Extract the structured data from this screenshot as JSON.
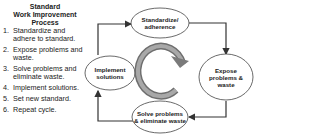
{
  "panel": {
    "title_line1": "Standard",
    "title_line2": "Work Improvement",
    "title_line3": "Process",
    "steps": [
      {
        "num": "1.",
        "text": "Standardize and adhere to standard."
      },
      {
        "num": "2.",
        "text": "Expose problems and waste."
      },
      {
        "num": "3.",
        "text": "Solve problems and eliminate waste."
      },
      {
        "num": "4.",
        "text": "Implement solutions."
      },
      {
        "num": "5.",
        "text": "Set new standard."
      },
      {
        "num": "6.",
        "text": "Repeat cycle."
      }
    ]
  },
  "cycle": {
    "nodes": {
      "standardize": "Standardize/ adherence",
      "expose": "Expose problems & waste",
      "solve": "Solve problems & eliminate waste",
      "implement": "Implement solutions"
    },
    "colors": {
      "arrow": "#333333",
      "cycle_arrow": "#8a8a8a",
      "ellipse_stroke": "#444444"
    }
  }
}
